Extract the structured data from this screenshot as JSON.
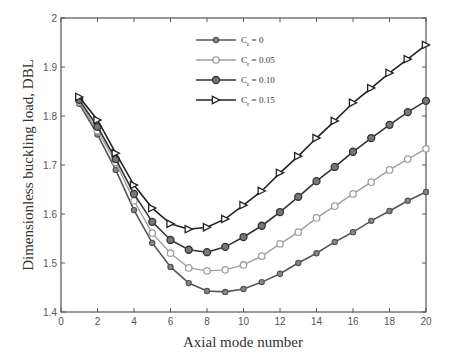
{
  "chart_data": {
    "type": "line",
    "title": "",
    "xlabel": "Axial mode number",
    "ylabel": "Dimensionless buckling load, DBL",
    "xlim": [
      0,
      20
    ],
    "ylim": [
      1.4,
      2.0
    ],
    "xticks": [
      0,
      2,
      4,
      6,
      8,
      10,
      12,
      14,
      16,
      18,
      20
    ],
    "yticks": [
      1.4,
      1.5,
      1.6,
      1.7,
      1.8,
      1.9,
      2.0
    ],
    "ytick_labels": [
      "1.4",
      "1.5",
      "1.6",
      "1.7",
      "1.8",
      "1.9",
      "2"
    ],
    "grid": false,
    "legend_position": "upper center (inside)",
    "x": [
      1,
      2,
      3,
      4,
      5,
      6,
      7,
      8,
      9,
      10,
      11,
      12,
      13,
      14,
      15,
      16,
      17,
      18,
      19,
      20
    ],
    "series": [
      {
        "name": "Cr = 0",
        "label_main": "C",
        "label_sub": "r",
        "label_value": " = 0",
        "color": "#555555",
        "marker": "circle-small",
        "values": [
          1.825,
          1.762,
          1.69,
          1.608,
          1.541,
          1.492,
          1.459,
          1.443,
          1.441,
          1.447,
          1.461,
          1.478,
          1.5,
          1.52,
          1.543,
          1.563,
          1.586,
          1.606,
          1.627,
          1.645
        ]
      },
      {
        "name": "Cr = 0.05",
        "label_main": "C",
        "label_sub": "r",
        "label_value": " = 0.05",
        "color": "#a0a0a0",
        "marker": "circle-open",
        "values": [
          1.829,
          1.77,
          1.705,
          1.627,
          1.561,
          1.52,
          1.49,
          1.484,
          1.486,
          1.496,
          1.514,
          1.539,
          1.563,
          1.592,
          1.616,
          1.641,
          1.665,
          1.69,
          1.712,
          1.733
        ]
      },
      {
        "name": "Cr = 0.10",
        "label_main": "C",
        "label_sub": "r",
        "label_value": " = 0.10",
        "color": "#333333",
        "marker": "circle-filled",
        "values": [
          1.833,
          1.778,
          1.712,
          1.641,
          1.584,
          1.547,
          1.527,
          1.522,
          1.533,
          1.553,
          1.576,
          1.604,
          1.635,
          1.667,
          1.696,
          1.727,
          1.755,
          1.782,
          1.808,
          1.831
        ]
      },
      {
        "name": "Cr = 0.15",
        "label_main": "C",
        "label_sub": "r",
        "label_value": " = 0.15",
        "color": "#222222",
        "marker": "triangle-right",
        "values": [
          1.839,
          1.792,
          1.724,
          1.659,
          1.612,
          1.58,
          1.569,
          1.573,
          1.59,
          1.618,
          1.647,
          1.684,
          1.718,
          1.755,
          1.79,
          1.827,
          1.857,
          1.888,
          1.916,
          1.945
        ]
      }
    ]
  }
}
